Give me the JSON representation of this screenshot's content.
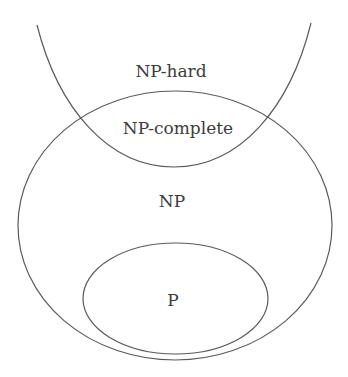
{
  "diagram": {
    "type": "venn / set-inclusion diagram",
    "sets": [
      {
        "id": "np-hard",
        "label": "NP-hard",
        "shape": "open U-curve (unbounded region above)"
      },
      {
        "id": "np-complete",
        "label": "NP-complete",
        "shape": "intersection of NP-hard and NP"
      },
      {
        "id": "np",
        "label": "NP",
        "shape": "large ellipse"
      },
      {
        "id": "p",
        "label": "P",
        "shape": "small ellipse inside NP"
      }
    ],
    "relations": [
      "P is a subset of NP",
      "NP-complete = NP ∩ NP-hard"
    ],
    "colors": {
      "stroke": "#5a5a5a",
      "text": "#3c3c3c",
      "background": "#ffffff"
    }
  },
  "labels": {
    "np_hard": "NP-hard",
    "np_complete": "NP-complete",
    "np": "NP",
    "p": "P"
  }
}
